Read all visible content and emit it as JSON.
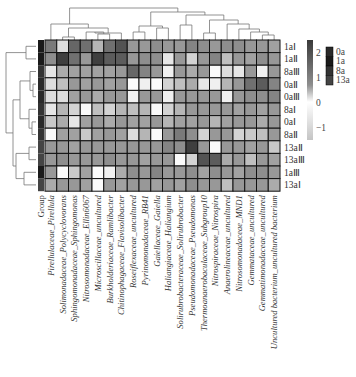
{
  "chart_data": {
    "type": "heatmap",
    "title": "",
    "rows": [
      "1aⅠ",
      "1aⅡ",
      "8aⅢ",
      "0aⅡ",
      "0aⅢ",
      "8aⅠ",
      "0aⅠ",
      "8aⅡ",
      "13aⅡ",
      "13aⅢ",
      "1aⅢ",
      "13aⅠ"
    ],
    "row_groups": [
      "1a",
      "1a",
      "8a",
      "0a",
      "0a",
      "8a",
      "0a",
      "8a",
      "13a",
      "13a",
      "1a",
      "13a"
    ],
    "columns": [
      "Pirellulaceae_Pirellula",
      "Solimonadaceae_Polycyclovorans",
      "Sphingomonadaceae_Sphingomonas",
      "Nitrosomonadaceae_Ellin6067",
      "Microscillaceae_uncultured",
      "Burkholderiaceae_Ramlibacter",
      "Chitinophagaceae_Flavisolibacter",
      "Roseiflexaceae_uncultured",
      "Pyrinomonadaceae_RB41",
      "Gaiellaceae_Gaiella",
      "Haliangiaceae_Haliangium",
      "Solirubrobacteraceae_Solirubrobacter",
      "Pseudomonadaceae_Pseudomonas",
      "Thermoanaerobaculaceae_Subgroup10",
      "Nitrospiraceae_Nitrospira",
      "Anaerolineaceae_uncultured",
      "Nitrosomonadaceae_MND1",
      "Gemmataceae_uncultured",
      "Gemmatimonadaceae_uncultured",
      "Uncultured bacterium_uncultured bacterium"
    ],
    "values": [
      [
        1.2,
        -0.8,
        1.6,
        1.4,
        0.0,
        1.4,
        2.0,
        0.6,
        0.6,
        0.8,
        0.6,
        0.6,
        1.0,
        0.8,
        0.6,
        0.8,
        0.8,
        0.6,
        0.6,
        0.4
      ],
      [
        0.8,
        2.4,
        1.4,
        0.6,
        2.4,
        1.8,
        1.8,
        0.6,
        0.8,
        0.8,
        -1.0,
        0.6,
        -0.6,
        0.6,
        1.0,
        -0.2,
        0.6,
        0.4,
        0.8,
        0.6
      ],
      [
        -1.0,
        0.2,
        0.4,
        0.4,
        0.4,
        0.4,
        0.6,
        1.6,
        1.0,
        0.6,
        -1.2,
        0.6,
        0.2,
        0.6,
        -1.4,
        -0.8,
        -1.0,
        0.6,
        -1.2,
        0.6
      ],
      [
        -0.8,
        -0.2,
        0.6,
        0.4,
        0.6,
        0.4,
        0.6,
        -1.4,
        -1.2,
        -1.4,
        -0.6,
        -0.2,
        0.2,
        -1.0,
        -1.2,
        0.0,
        0.6,
        1.4,
        1.8,
        1.0
      ],
      [
        -0.8,
        -0.8,
        0.4,
        0.6,
        0.2,
        0.6,
        0.6,
        -1.2,
        0.6,
        0.6,
        -1.2,
        0.6,
        0.6,
        0.6,
        0.6,
        -1.2,
        0.6,
        0.8,
        0.8,
        1.0
      ],
      [
        -1.0,
        0.0,
        -0.6,
        -1.4,
        -0.2,
        -0.6,
        0.0,
        -0.2,
        0.0,
        -1.4,
        -0.6,
        0.0,
        0.6,
        0.6,
        0.6,
        0.6,
        0.4,
        0.6,
        0.4,
        0.6
      ],
      [
        -0.4,
        0.2,
        -1.0,
        0.4,
        0.6,
        0.2,
        0.6,
        0.4,
        0.4,
        0.6,
        0.0,
        0.4,
        0.4,
        0.6,
        0.0,
        0.4,
        0.6,
        0.6,
        0.2,
        0.6
      ],
      [
        -1.4,
        0.4,
        0.4,
        -0.4,
        0.4,
        0.6,
        0.4,
        -0.8,
        0.0,
        -1.4,
        0.6,
        1.2,
        0.8,
        -0.6,
        0.6,
        0.6,
        -0.6,
        -0.4,
        -0.2,
        0.6
      ],
      [
        0.6,
        0.6,
        0.4,
        0.6,
        0.6,
        0.6,
        0.6,
        0.6,
        0.6,
        0.6,
        1.0,
        0.8,
        2.4,
        0.6,
        -1.4,
        0.6,
        0.6,
        0.4,
        0.6,
        -0.4
      ],
      [
        0.6,
        0.8,
        0.6,
        0.6,
        0.6,
        0.8,
        0.6,
        0.6,
        0.4,
        0.6,
        0.6,
        -1.4,
        -0.6,
        2.0,
        1.8,
        0.2,
        0.6,
        -0.2,
        0.6,
        0.4
      ],
      [
        0.6,
        -1.4,
        -0.4,
        0.4,
        -1.4,
        -1.2,
        0.2,
        0.8,
        0.6,
        1.0,
        0.6,
        0.6,
        0.8,
        0.4,
        0.8,
        0.6,
        0.4,
        0.8,
        0.8,
        0.6
      ],
      [
        0.2,
        0.6,
        0.6,
        0.4,
        -1.4,
        0.6,
        0.4,
        0.6,
        0.6,
        0.4,
        0.6,
        0.4,
        0.8,
        0.6,
        0.6,
        -0.2,
        0.6,
        0.6,
        0.6,
        0.2
      ]
    ],
    "group_label": "Group",
    "color_scale": {
      "min": -1.5,
      "max": 2.5,
      "low_color": "#ffffff",
      "high_color": "#3a3a3a",
      "ticks": [
        2,
        1,
        0,
        -1
      ]
    },
    "group_legend": [
      {
        "label": "0a",
        "color": "#2a2a2a"
      },
      {
        "label": "1a",
        "color": "#1a1a1a"
      },
      {
        "label": "8a",
        "color": "#333333"
      },
      {
        "label": "13a",
        "color": "#444444"
      }
    ],
    "legend_placement": "right",
    "row_dendrogram": true,
    "column_dendrogram": true
  }
}
